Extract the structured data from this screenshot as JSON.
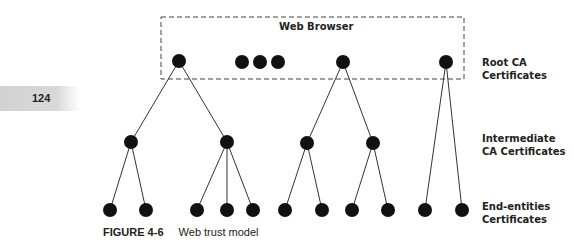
{
  "page": {
    "number": "124"
  },
  "browser_box": {
    "label": "Web Browser",
    "x": 161,
    "y": 17,
    "width": 303,
    "height": 62
  },
  "levels": [
    {
      "id": "root",
      "line1": "Root CA",
      "line2": "Certificates",
      "top": 56
    },
    {
      "id": "intermediate",
      "line1": "Intermediate",
      "line2": "CA Certificates",
      "top": 132
    },
    {
      "id": "end",
      "line1": "End-entities",
      "line2": "Certificates",
      "top": 200
    }
  ],
  "caption": {
    "figure_number": "FIGURE 4-6",
    "title": "Web trust model"
  },
  "node_radius": 7,
  "ellipsis_dots": [
    {
      "x": 242,
      "y": 62
    },
    {
      "x": 260,
      "y": 62
    },
    {
      "x": 278,
      "y": 62
    }
  ],
  "nodes": {
    "roots": [
      {
        "id": "r1",
        "x": 179,
        "y": 61
      },
      {
        "id": "r2",
        "x": 343,
        "y": 62
      },
      {
        "id": "r3",
        "x": 446,
        "y": 62
      }
    ],
    "intermediates": [
      {
        "id": "i1",
        "parent": "r1",
        "x": 131,
        "y": 142
      },
      {
        "id": "i2",
        "parent": "r1",
        "x": 227,
        "y": 142
      },
      {
        "id": "i3",
        "parent": "r2",
        "x": 307,
        "y": 143
      },
      {
        "id": "i4",
        "parent": "r2",
        "x": 373,
        "y": 143
      }
    ],
    "leaves": [
      {
        "parent": "i1",
        "x": 110,
        "y": 210
      },
      {
        "parent": "i1",
        "x": 146,
        "y": 210
      },
      {
        "parent": "i2",
        "x": 197,
        "y": 210
      },
      {
        "parent": "i2",
        "x": 227,
        "y": 210
      },
      {
        "parent": "i2",
        "x": 253,
        "y": 210
      },
      {
        "parent": "i3",
        "x": 285,
        "y": 210
      },
      {
        "parent": "i3",
        "x": 322,
        "y": 210
      },
      {
        "parent": "i4",
        "x": 352,
        "y": 210
      },
      {
        "parent": "i4",
        "x": 388,
        "y": 210
      },
      {
        "parent": "r3",
        "x": 425,
        "y": 210
      },
      {
        "parent": "r3",
        "x": 462,
        "y": 210
      }
    ]
  },
  "colors": {
    "node": "#111111",
    "edge": "#333333",
    "dash": "#444444",
    "text": "#222222"
  }
}
